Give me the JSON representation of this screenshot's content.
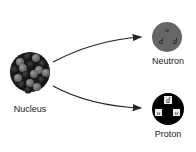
{
  "diagram": {
    "nucleus": {
      "label": "Nucleus"
    },
    "neutron": {
      "label": "Neutron",
      "color": "#666666",
      "quarks": [
        "u",
        "d",
        "d"
      ]
    },
    "proton": {
      "label": "Proton",
      "color": "#000000",
      "quarks": [
        "d",
        "u",
        "u"
      ]
    },
    "arrows": [
      {
        "from": "nucleus",
        "to": "neutron"
      },
      {
        "from": "nucleus",
        "to": "proton"
      }
    ]
  }
}
